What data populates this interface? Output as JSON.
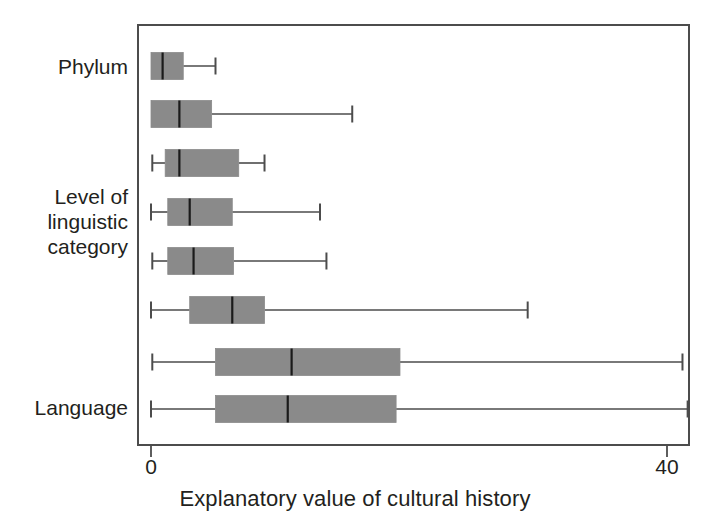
{
  "chart_data": {
    "type": "box",
    "title": "",
    "xlabel": "Explanatory value of cultural history",
    "ylabel": "",
    "xlim": [
      0,
      43
    ],
    "xticks": [
      0,
      40
    ],
    "xticklabels": [
      "0",
      "40"
    ],
    "grid": false,
    "legend": null,
    "orientation": "horizontal",
    "y_axis_group_labels": [
      {
        "text": "Phylum",
        "rows": [
          1
        ]
      },
      {
        "text": "Level of\nlinguistic\ncategory",
        "rows": [
          3,
          4,
          5
        ]
      },
      {
        "text": "Language",
        "rows": [
          8
        ]
      }
    ],
    "boxes": [
      {
        "row": 1,
        "whisker_low": 0.0,
        "q1": 0.0,
        "median": 0.9,
        "q3": 2.5,
        "whisker_high": 5.0,
        "low_cap": false,
        "high_cap": true
      },
      {
        "row": 2,
        "whisker_low": 0.0,
        "q1": 0.0,
        "median": 2.2,
        "q3": 4.7,
        "whisker_high": 15.6,
        "low_cap": false,
        "high_cap": true
      },
      {
        "row": 3,
        "whisker_low": 0.1,
        "q1": 1.1,
        "median": 2.2,
        "q3": 6.8,
        "whisker_high": 8.8,
        "low_cap": true,
        "high_cap": true
      },
      {
        "row": 4,
        "whisker_low": 0.0,
        "q1": 1.3,
        "median": 3.0,
        "q3": 6.3,
        "whisker_high": 13.1,
        "low_cap": true,
        "high_cap": true
      },
      {
        "row": 5,
        "whisker_low": 0.1,
        "q1": 1.3,
        "median": 3.3,
        "q3": 6.4,
        "whisker_high": 13.6,
        "low_cap": true,
        "high_cap": true
      },
      {
        "row": 6,
        "whisker_low": 0.0,
        "q1": 3.0,
        "median": 6.3,
        "q3": 8.8,
        "whisker_high": 29.2,
        "low_cap": true,
        "high_cap": true
      },
      {
        "row": 7,
        "whisker_low": 0.1,
        "q1": 5.0,
        "median": 10.9,
        "q3": 19.3,
        "whisker_high": 41.2,
        "low_cap": true,
        "high_cap": true
      },
      {
        "row": 8,
        "whisker_low": 0.0,
        "q1": 5.0,
        "median": 10.6,
        "q3": 19.0,
        "whisker_high": 41.6,
        "low_cap": true,
        "high_cap": true
      }
    ],
    "colors": {
      "box_fill": "#8a8a8a",
      "box_edge": "#8a8a8a",
      "median": "#1a1a1a",
      "whisker": "#4c4c4c",
      "frame": "#4c4c4c",
      "text": "#231f20",
      "background": "#ffffff"
    }
  },
  "axis": {
    "x_title": "Explanatory value of cultural history",
    "tick_0": "0",
    "tick_40": "40"
  },
  "categories": {
    "phylum": "Phylum",
    "level_line1": "Level of",
    "level_line2": "linguistic",
    "level_line3": "category",
    "language": "Language"
  }
}
